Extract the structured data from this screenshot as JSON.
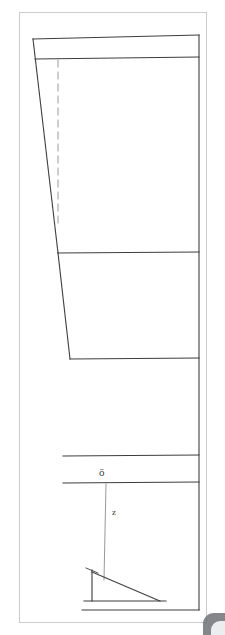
{
  "document": {
    "kind": "technical-line-drawing",
    "background_color": "#ffffff",
    "sheet_border_color": "#c9cbcd",
    "line_color": "#3d3d3d"
  },
  "labels": {
    "sigma": "ō",
    "n": "z"
  },
  "chart_data": {
    "type": "diagram",
    "title": "",
    "xlabel": "",
    "ylabel": "",
    "units": "px",
    "canvas": {
      "width": 225,
      "height": 635
    },
    "sheet": {
      "x": 19,
      "y": 12,
      "width": 188,
      "height": 611
    },
    "elements": [
      {
        "name": "top-edge",
        "type": "polyline",
        "points": [
          [
            33,
            39
          ],
          [
            199,
            35
          ]
        ]
      },
      {
        "name": "second-horizontal",
        "type": "polyline",
        "points": [
          [
            35,
            59
          ],
          [
            199,
            57
          ]
        ]
      },
      {
        "name": "right-vertical",
        "type": "polyline",
        "points": [
          [
            199,
            35
          ],
          [
            199,
            610
          ]
        ]
      },
      {
        "name": "left-taper-upper",
        "type": "polyline",
        "points": [
          [
            33,
            39
          ],
          [
            58,
            253
          ]
        ]
      },
      {
        "name": "left-taper-lower",
        "type": "polyline",
        "points": [
          [
            58,
            253
          ],
          [
            70,
            359
          ]
        ]
      },
      {
        "name": "divider-1",
        "type": "polyline",
        "points": [
          [
            58,
            253
          ],
          [
            199,
            252
          ]
        ]
      },
      {
        "name": "divider-2",
        "type": "polyline",
        "points": [
          [
            70,
            359
          ],
          [
            199,
            358
          ]
        ]
      },
      {
        "name": "divider-3",
        "type": "polyline",
        "points": [
          [
            63,
            456
          ],
          [
            199,
            455
          ]
        ]
      },
      {
        "name": "divider-4",
        "type": "polyline",
        "points": [
          [
            63,
            483
          ],
          [
            199,
            482
          ]
        ]
      },
      {
        "name": "bottom-edge",
        "type": "polyline",
        "points": [
          [
            82,
            610
          ],
          [
            199,
            610
          ]
        ]
      },
      {
        "name": "dashed-centre-line",
        "type": "dashed",
        "points": [
          [
            58,
            60
          ],
          [
            58,
            228
          ]
        ]
      },
      {
        "name": "hanging-line",
        "type": "polyline",
        "points": [
          [
            106,
            484
          ],
          [
            104,
            580
          ]
        ]
      },
      {
        "name": "triangle-vertical",
        "type": "polyline",
        "points": [
          [
            92,
            570
          ],
          [
            92,
            601
          ]
        ]
      },
      {
        "name": "triangle-hypotenuse",
        "type": "polyline",
        "points": [
          [
            92,
            572
          ],
          [
            160,
            601
          ]
        ]
      },
      {
        "name": "triangle-base",
        "type": "polyline",
        "points": [
          [
            84,
            601
          ],
          [
            166,
            601
          ]
        ]
      },
      {
        "name": "triangle-arrow-tick",
        "type": "polyline",
        "points": [
          [
            86,
            568
          ],
          [
            98,
            573
          ]
        ]
      }
    ]
  },
  "corner": {
    "name": "page-curl",
    "color": "#6f7175"
  }
}
